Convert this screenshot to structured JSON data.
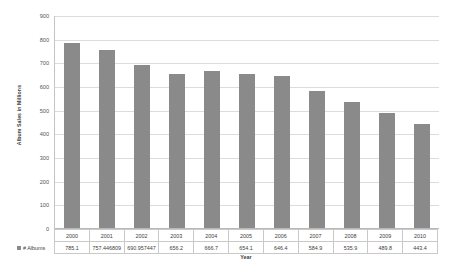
{
  "chart_data": {
    "type": "bar",
    "title": "",
    "xlabel": "Year",
    "ylabel": "Album Sales in Millions",
    "categories": [
      "2000",
      "2001",
      "2002",
      "2003",
      "2004",
      "2005",
      "2006",
      "2007",
      "2008",
      "2009",
      "2010"
    ],
    "values": [
      785.1,
      757.446809,
      690.957447,
      656.2,
      666.7,
      654.1,
      646.4,
      584.9,
      535.9,
      489.8,
      443.4
    ],
    "value_labels": [
      "785.1",
      "757.446809",
      "690.957447",
      "656.2",
      "666.7",
      "654.1",
      "646.4",
      "584.9",
      "535.9",
      "489.8",
      "443.4"
    ],
    "series_name": "# Albums",
    "ylim": [
      0,
      900
    ],
    "yticks": [
      0,
      100,
      200,
      300,
      400,
      500,
      600,
      700,
      800,
      900
    ],
    "ytick_labels": [
      "0",
      "100",
      "200",
      "300",
      "400",
      "500",
      "600",
      "700",
      "800",
      "900"
    ],
    "grid": true,
    "legend_position": "data-table",
    "bar_color": "#8a8a8a",
    "gridline_color": "#dcdcdc"
  },
  "table": {
    "row_label": "# Albums"
  }
}
